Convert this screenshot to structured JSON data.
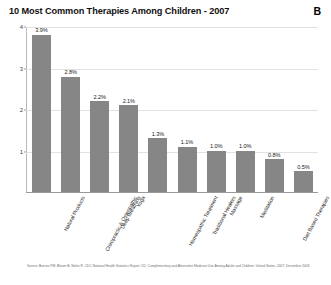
{
  "chart_data": {
    "type": "bar",
    "title": "10 Most Common Therapies Among Children - 2007",
    "panel_label": "B",
    "xlabel": "",
    "ylabel": "",
    "ylim": [
      0,
      4
    ],
    "grid": true,
    "legend": "none",
    "y_ticks": [
      "1",
      "2",
      "3",
      "4"
    ],
    "y_tick_values": [
      1,
      2,
      3,
      4
    ],
    "categories": [
      "Natural Products",
      "Chiropractic & Osteopathic",
      "Deep Breathing",
      "Yoga",
      "Homeopathic Treatment",
      "Traditional Healers",
      "Massage",
      "Meditation",
      "Diet Based Therapies",
      "Progressive Relaxation"
    ],
    "values": [
      3.9,
      2.8,
      2.2,
      2.1,
      1.3,
      1.1,
      1.0,
      1.0,
      0.8,
      0.5
    ],
    "data_labels": [
      "3.9%",
      "2.8%",
      "2.2%",
      "2.1%",
      "1.3%",
      "1.1%",
      "1.0%",
      "1.0%",
      "0.8%",
      "0.5%"
    ],
    "bar_color": "#868686",
    "source": "Source: Barnes PM, Bloom B, Nahin R. CDC National Health Statistics Report #12. Complementary and Alternative Medicine Use Among Adults and Children: United States, 2007. December 2008."
  }
}
